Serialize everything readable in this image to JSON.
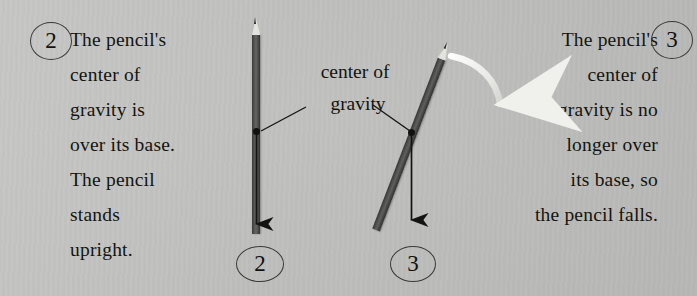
{
  "figure": {
    "background_color": "#c3c4c2",
    "ink_color": "#14140f",
    "pencil_color": "#4a4a48",
    "pencil_wood_color": "#e4e3dd",
    "motion_arrow_color": "#f2f2ee"
  },
  "panels": {
    "left": {
      "step_number": "2",
      "caption_lines": [
        "The pencil's",
        "center of",
        "gravity is",
        "over its base.",
        "The pencil",
        "stands",
        "upright."
      ],
      "caption_text": "The pencil's center of gravity is over its base. The pencil stands upright.",
      "figure_number": "2"
    },
    "right": {
      "step_number": "3",
      "caption_lines": [
        "The pencil's",
        "center of",
        "gravity is no",
        "longer over",
        "its base, so",
        "the pencil falls."
      ],
      "caption_text": "The pencil's center of gravity is no longer over its base, so the pencil falls.",
      "figure_number": "3"
    }
  },
  "annotation": {
    "label_lines": [
      "center of",
      "gravity"
    ],
    "label_text": "center of gravity",
    "leader_left": "points to center of gravity of upright pencil",
    "leader_right": "points to center of gravity of tilting pencil"
  },
  "diagram": {
    "upright_pencil": {
      "name": "upright pencil",
      "tip_direction": "up",
      "gravity_arrow": "downward from center of gravity to base"
    },
    "tilted_pencil": {
      "name": "tilted pencil",
      "tilt_degrees": "21",
      "tip_direction": "up-right",
      "gravity_arrow": "downward from center of gravity, falling outside base",
      "motion_arrow": "curved arrow showing pencil falling to the right"
    }
  }
}
